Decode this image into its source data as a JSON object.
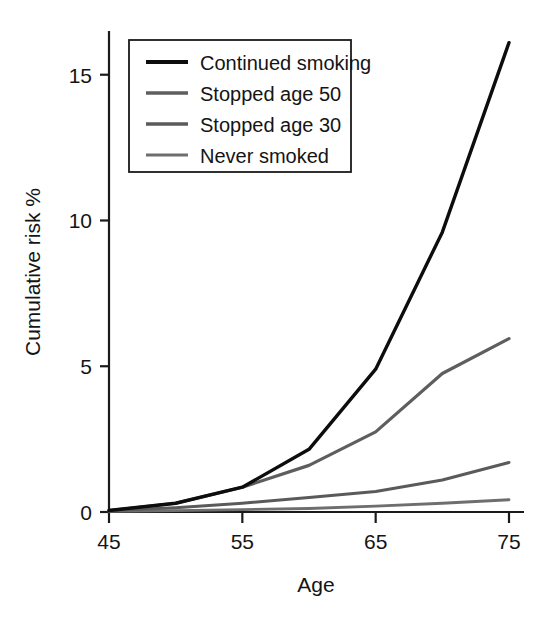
{
  "chart_data": {
    "type": "line",
    "title": "",
    "xlabel": "Age",
    "ylabel": "Cumulative risk %",
    "xlim": [
      45,
      75
    ],
    "ylim": [
      0,
      16.5
    ],
    "xticks": [
      45,
      55,
      65,
      75
    ],
    "xtick_labels": [
      "45",
      "55",
      "65",
      "75"
    ],
    "yticks": [
      0,
      5,
      10,
      15
    ],
    "ytick_labels": [
      "0",
      "5",
      "10",
      "15"
    ],
    "grid": false,
    "legend_position": "upper-left",
    "x": [
      45,
      50,
      55,
      60,
      65,
      70,
      75
    ],
    "series": [
      {
        "name": "Continued smoking",
        "color": "#0d0d0d",
        "width": 3.4,
        "values": [
          0.05,
          0.3,
          0.85,
          2.15,
          4.9,
          9.6,
          16.1
        ]
      },
      {
        "name": "Stopped age 50",
        "color": "#5e5e5e",
        "width": 3.2,
        "values": [
          0.05,
          0.3,
          0.85,
          1.6,
          2.75,
          4.75,
          5.95
        ]
      },
      {
        "name": "Stopped age 30",
        "color": "#5a5a5a",
        "width": 3.0,
        "values": [
          0.05,
          0.15,
          0.3,
          0.5,
          0.7,
          1.1,
          1.7
        ]
      },
      {
        "name": "Never smoked",
        "color": "#6e6e6e",
        "width": 2.8,
        "values": [
          0.02,
          0.05,
          0.08,
          0.12,
          0.2,
          0.3,
          0.42
        ]
      }
    ]
  },
  "legend": {
    "entries": [
      {
        "label": "Continued smoking",
        "color": "#0d0d0d",
        "width": 4.0
      },
      {
        "label": "Stopped age 50",
        "color": "#5e5e5e",
        "width": 3.4
      },
      {
        "label": "Stopped age 30",
        "color": "#5a5a5a",
        "width": 3.4
      },
      {
        "label": "Never smoked",
        "color": "#6e6e6e",
        "width": 3.0
      }
    ]
  },
  "axes": {
    "x_title": "Age",
    "y_title": "Cumulative risk %"
  }
}
